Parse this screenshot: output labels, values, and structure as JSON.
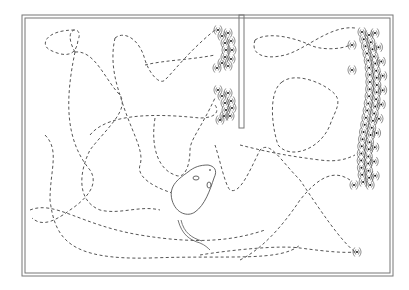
{
  "figure": {
    "title": "",
    "regions": [
      "main-arena",
      "partition-wall",
      "right-chamber"
    ],
    "elements": {
      "subject": "mouse",
      "trail_style": "dashed",
      "call_marker": "sound-wave-symbol"
    },
    "colors": {
      "line": "#555555",
      "frame": "#777777",
      "background": "#ffffff"
    }
  }
}
